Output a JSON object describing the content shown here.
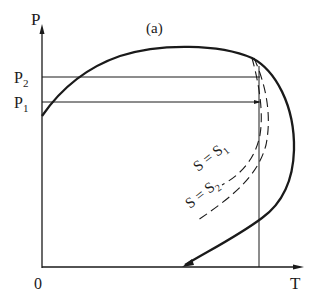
{
  "diagram": {
    "panel_label": "(a)",
    "axes": {
      "y_label": "P",
      "x_label": "T",
      "origin_label": "0"
    },
    "pressure_levels": [
      {
        "label": "P",
        "subscript": "2"
      },
      {
        "label": "P",
        "subscript": "1"
      }
    ],
    "isentropes": [
      {
        "label": "S = S",
        "subscript": "1"
      },
      {
        "label": "S = S",
        "subscript": "2"
      }
    ],
    "colors": {
      "ink": "#1a1a1a",
      "background": "#ffffff"
    }
  }
}
